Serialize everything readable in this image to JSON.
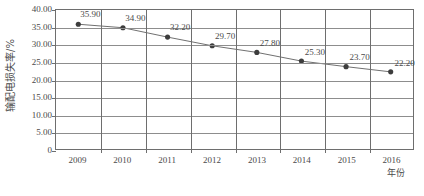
{
  "chart_data": {
    "type": "line",
    "title": "",
    "xlabel": "年份",
    "ylabel": "输配电损失率/%",
    "categories": [
      "2009",
      "2010",
      "2011",
      "2012",
      "2013",
      "2014",
      "2015",
      "2016"
    ],
    "values": [
      35.9,
      34.9,
      32.2,
      29.7,
      27.8,
      25.3,
      23.7,
      22.2
    ],
    "point_labels": [
      "35.90",
      "34.90",
      "32.20",
      "29.70",
      "27.80",
      "25.30",
      "23.70",
      "22.20"
    ],
    "ylim": [
      0,
      40
    ],
    "y_ticks": [
      40.0,
      35.0,
      30.0,
      25.0,
      20.0,
      15.0,
      10.0,
      5.0,
      0
    ],
    "y_tick_labels": [
      "40.00",
      "35.00",
      "30.00",
      "25.00",
      "20.00",
      "15.00",
      "10.00",
      "5.00",
      "0"
    ],
    "grid": "both",
    "legend": "none",
    "series": [
      {
        "name": "输配电损失率",
        "values": [
          35.9,
          34.9,
          32.2,
          29.7,
          27.8,
          25.3,
          23.7,
          22.2
        ],
        "marker": "filled-circle",
        "line_color": "#6e6e6e",
        "marker_color": "#3d3d3d"
      }
    ],
    "colors": {
      "line": "#6e6e6e",
      "marker": "#3d3d3d",
      "grid": "#8d8d8d",
      "axis": "#6e6e6e",
      "text": "#4a4a4a",
      "background": "#ffffff"
    }
  },
  "caption": {
    "text": ""
  }
}
